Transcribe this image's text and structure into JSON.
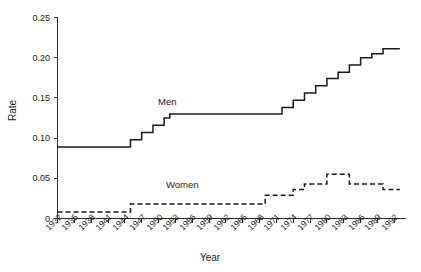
{
  "chart_data": {
    "type": "line",
    "title": "",
    "xlabel": "Year",
    "ylabel": "Rate",
    "xlim": [
      1932,
      1994
    ],
    "ylim": [
      0,
      0.25
    ],
    "grid": false,
    "legend_position": "inline-annotations",
    "x_tick_labels": [
      "1932",
      "1935",
      "1938",
      "1941",
      "1944",
      "1947",
      "1950",
      "1953",
      "1956",
      "1959",
      "1962",
      "1965",
      "1968",
      "1971",
      "1974",
      "1977",
      "1980",
      "1983",
      "1986",
      "1989",
      "1992"
    ],
    "x_tick_values": [
      1932,
      1935,
      1938,
      1941,
      1944,
      1947,
      1950,
      1953,
      1956,
      1959,
      1962,
      1965,
      1968,
      1971,
      1974,
      1977,
      1980,
      1983,
      1986,
      1989,
      1992
    ],
    "y_tick_labels": [
      "0",
      "0.05",
      "0.10",
      "0.15",
      "0.20",
      "0.25"
    ],
    "y_tick_values": [
      0,
      0.05,
      0.1,
      0.15,
      0.2,
      0.25
    ],
    "annotations": [
      {
        "text": "Men",
        "x": 1953,
        "y": 0.148
      },
      {
        "text": "Women",
        "x": 1955,
        "y": 0.044
      }
    ],
    "series": [
      {
        "name": "Men",
        "style": "solid",
        "color": "#1a1a1a",
        "x": [
          1932,
          1933,
          1934,
          1935,
          1936,
          1937,
          1938,
          1939,
          1940,
          1941,
          1942,
          1943,
          1944,
          1945,
          1946,
          1947,
          1948,
          1949,
          1950,
          1951,
          1952,
          1953,
          1954,
          1955,
          1956,
          1957,
          1958,
          1959,
          1960,
          1961,
          1962,
          1963,
          1964,
          1965,
          1966,
          1967,
          1968,
          1969,
          1970,
          1971,
          1972,
          1973,
          1974,
          1975,
          1976,
          1977,
          1978,
          1979,
          1980,
          1981,
          1982,
          1983,
          1984,
          1985,
          1986,
          1987,
          1988,
          1989,
          1990,
          1991,
          1992,
          1993
        ],
        "y": [
          0.089,
          0.089,
          0.089,
          0.089,
          0.089,
          0.089,
          0.089,
          0.089,
          0.089,
          0.089,
          0.089,
          0.089,
          0.089,
          0.098,
          0.098,
          0.107,
          0.107,
          0.116,
          0.116,
          0.125,
          0.13,
          0.13,
          0.13,
          0.13,
          0.13,
          0.13,
          0.13,
          0.13,
          0.13,
          0.13,
          0.13,
          0.13,
          0.13,
          0.13,
          0.13,
          0.13,
          0.13,
          0.13,
          0.13,
          0.13,
          0.138,
          0.138,
          0.147,
          0.147,
          0.156,
          0.156,
          0.165,
          0.165,
          0.174,
          0.174,
          0.182,
          0.182,
          0.191,
          0.191,
          0.2,
          0.2,
          0.205,
          0.205,
          0.211,
          0.211,
          0.211,
          0.211
        ]
      },
      {
        "name": "Women",
        "style": "dashed",
        "color": "#1a1a1a",
        "x": [
          1932,
          1933,
          1934,
          1935,
          1936,
          1937,
          1938,
          1939,
          1940,
          1941,
          1942,
          1943,
          1944,
          1945,
          1946,
          1947,
          1948,
          1949,
          1950,
          1951,
          1952,
          1953,
          1954,
          1955,
          1956,
          1957,
          1958,
          1959,
          1960,
          1961,
          1962,
          1963,
          1964,
          1965,
          1966,
          1967,
          1968,
          1969,
          1970,
          1971,
          1972,
          1973,
          1974,
          1975,
          1976,
          1977,
          1978,
          1979,
          1980,
          1981,
          1982,
          1983,
          1984,
          1985,
          1986,
          1987,
          1988,
          1989,
          1990,
          1991,
          1992,
          1993
        ],
        "y": [
          0.008,
          0.008,
          0.008,
          0.008,
          0.008,
          0.008,
          0.008,
          0.008,
          0.008,
          0.008,
          0.008,
          0.008,
          0.008,
          0.018,
          0.018,
          0.018,
          0.018,
          0.018,
          0.018,
          0.018,
          0.018,
          0.018,
          0.018,
          0.018,
          0.018,
          0.018,
          0.018,
          0.018,
          0.018,
          0.018,
          0.018,
          0.018,
          0.018,
          0.018,
          0.018,
          0.018,
          0.018,
          0.029,
          0.029,
          0.029,
          0.029,
          0.029,
          0.036,
          0.036,
          0.043,
          0.043,
          0.043,
          0.043,
          0.055,
          0.055,
          0.055,
          0.055,
          0.043,
          0.043,
          0.043,
          0.043,
          0.043,
          0.043,
          0.036,
          0.036,
          0.036,
          0.036
        ]
      }
    ]
  }
}
